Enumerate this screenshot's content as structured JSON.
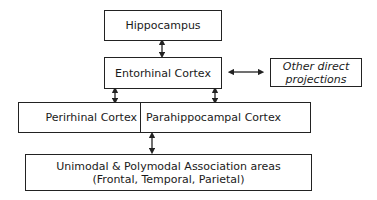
{
  "diagram": {
    "nodes": {
      "hippocampus": {
        "label": "Hippocampus"
      },
      "entorhinal": {
        "label": "Entorhinal Cortex"
      },
      "other": {
        "line1": "Other direct",
        "line2": "projections"
      },
      "perirhinal": {
        "label": "Perirhinal Cortex"
      },
      "parahippocampal": {
        "label": "Parahippocampal Cortex"
      },
      "association": {
        "line1": "Unimodal & Polymodal Association areas",
        "line2": "(Frontal, Temporal, Parietal)"
      }
    },
    "edges": [
      {
        "from": "hippocampus",
        "to": "entorhinal",
        "type": "bidirectional"
      },
      {
        "from": "entorhinal",
        "to": "other",
        "type": "bidirectional"
      },
      {
        "from": "entorhinal",
        "to": "perirhinal",
        "type": "bidirectional"
      },
      {
        "from": "entorhinal",
        "to": "parahippocampal",
        "type": "bidirectional"
      },
      {
        "from": "perirhinal/parahippocampal",
        "to": "association",
        "type": "bidirectional"
      }
    ]
  }
}
